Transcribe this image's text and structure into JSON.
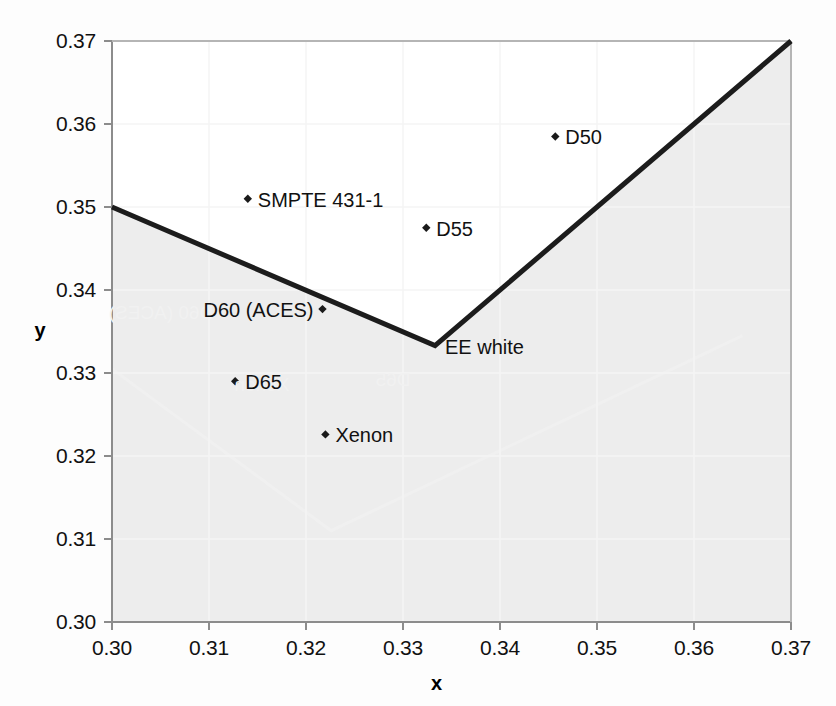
{
  "chart_data": {
    "type": "scatter",
    "title": "",
    "xlabel": "x",
    "ylabel": "y",
    "xlim": [
      0.3,
      0.37
    ],
    "ylim": [
      0.3,
      0.37
    ],
    "xticks": [
      "0.30",
      "0.31",
      "0.32",
      "0.33",
      "0.34",
      "0.35",
      "0.36",
      "0.37"
    ],
    "yticks": [
      "0.30",
      "0.31",
      "0.32",
      "0.33",
      "0.34",
      "0.35",
      "0.36",
      "0.37"
    ],
    "xtick_values": [
      0.3,
      0.31,
      0.32,
      0.33,
      0.34,
      0.35,
      0.36,
      0.37
    ],
    "ytick_values": [
      0.3,
      0.31,
      0.32,
      0.33,
      0.34,
      0.35,
      0.36,
      0.37
    ],
    "grid": false,
    "legend": "none",
    "points": [
      {
        "label": "SMPTE 431-1",
        "x": 0.314,
        "y": 0.351,
        "label_side": "right"
      },
      {
        "label": "D50",
        "x": 0.3457,
        "y": 0.3585,
        "label_side": "right"
      },
      {
        "label": "D55",
        "x": 0.3324,
        "y": 0.3475,
        "label_side": "right"
      },
      {
        "label": "D60 (ACES)",
        "x": 0.3217,
        "y": 0.3377,
        "label_side": "left"
      },
      {
        "label": "D65",
        "x": 0.3127,
        "y": 0.329,
        "label_side": "right"
      },
      {
        "label": "Xenon",
        "x": 0.322,
        "y": 0.3226,
        "label_side": "right"
      },
      {
        "label": "EE white",
        "x": 0.3333,
        "y": 0.3333,
        "label_side": "right"
      }
    ],
    "boundary_line": {
      "name": "white-point tolerance boundary",
      "vertices": [
        {
          "x": 0.3,
          "y": 0.35
        },
        {
          "x": 0.3333,
          "y": 0.3333
        },
        {
          "x": 0.37,
          "y": 0.37
        }
      ]
    },
    "shaded_region": {
      "name": "region below boundary",
      "color": "#ededed"
    },
    "colors": {
      "line": "#1c1c1c",
      "marker": "#1a1a1a",
      "shade": "#ededed",
      "axis": "#8a8a8a",
      "text": "#111111",
      "ghost": "#f2f2f2"
    }
  },
  "ghost_layer": {
    "name": "page-bleed-through",
    "vertices": [
      {
        "x": 0.3,
        "y": 0.3305
      },
      {
        "x": 0.3226,
        "y": 0.311
      },
      {
        "x": 0.365,
        "y": 0.3345
      }
    ],
    "labels": [
      {
        "text": "D60 (ACES)",
        "x": 0.305,
        "y": 0.3372
      },
      {
        "text": "Xenon",
        "x": 0.3155,
        "y": 0.3285
      },
      {
        "text": "D65",
        "x": 0.329,
        "y": 0.3292
      }
    ]
  }
}
